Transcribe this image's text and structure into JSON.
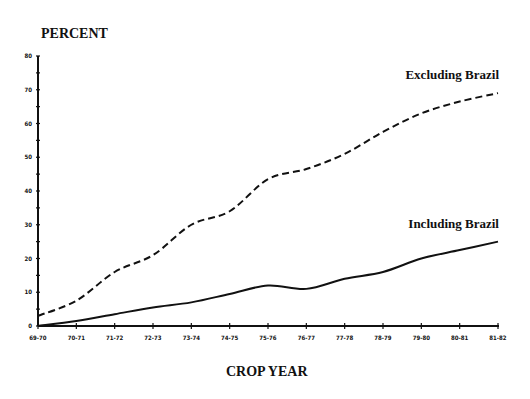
{
  "chart_data": {
    "type": "line",
    "title": "",
    "xlabel": "CROP YEAR",
    "ylabel": "PERCENT",
    "ylim": [
      0,
      80
    ],
    "yticks": [
      0,
      10,
      20,
      30,
      40,
      50,
      60,
      70,
      80
    ],
    "grid": false,
    "legend_position": "inline labels at right end of lines",
    "categories": [
      "69-70",
      "70-71",
      "71-72",
      "72-73",
      "73-74",
      "74-75",
      "75-76",
      "76-77",
      "77-78",
      "78-79",
      "79-80",
      "80-81",
      "81-82"
    ],
    "series": [
      {
        "name": "Excluding Brazil",
        "style": "dashed",
        "values": [
          3,
          7.5,
          16,
          21,
          30,
          34,
          43.5,
          46.5,
          51,
          57.5,
          63,
          66.5,
          69
        ]
      },
      {
        "name": "Including Brazil",
        "style": "solid",
        "values": [
          0,
          1.5,
          3.5,
          5.5,
          7,
          9.5,
          12,
          11,
          14,
          16,
          20,
          22.5,
          25
        ]
      }
    ]
  }
}
